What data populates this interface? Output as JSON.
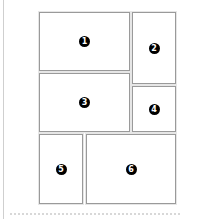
{
  "diagram": {
    "type": "page-layout",
    "panels": [
      {
        "id": 1,
        "label": "1",
        "x": 39,
        "y": 12,
        "w": 91,
        "h": 59
      },
      {
        "id": 2,
        "label": "2",
        "x": 132,
        "y": 12,
        "w": 44,
        "h": 72
      },
      {
        "id": 3,
        "label": "3",
        "x": 39,
        "y": 73,
        "w": 91,
        "h": 59
      },
      {
        "id": 4,
        "label": "4",
        "x": 132,
        "y": 86,
        "w": 44,
        "h": 46
      },
      {
        "id": 5,
        "label": "5",
        "x": 39,
        "y": 134,
        "w": 44,
        "h": 70
      },
      {
        "id": 6,
        "label": "6",
        "x": 86,
        "y": 134,
        "w": 90,
        "h": 70
      }
    ],
    "colors": {
      "panel_border": "#9a9a9a",
      "badge_fill": "#000000",
      "badge_text": "#ffffff",
      "background": "#ffffff"
    }
  }
}
